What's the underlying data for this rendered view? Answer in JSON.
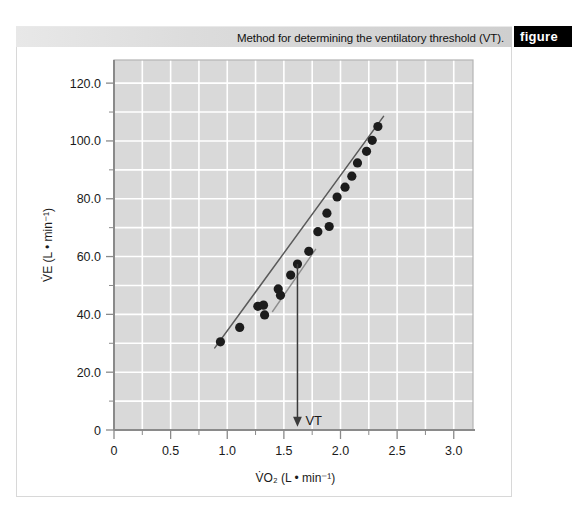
{
  "header": {
    "caption": "Method for determining the ventilatory threshold (VT).",
    "tab_label": "figure"
  },
  "chart_data": {
    "type": "scatter",
    "title": "",
    "subtitle": "",
    "xlabel": "V̇O₂ (L • min⁻¹)",
    "ylabel": "V̇E (L • min⁻¹)",
    "xlim": [
      0,
      3.17
    ],
    "ylim": [
      0,
      128
    ],
    "xticks": [
      0,
      0.5,
      1.0,
      1.5,
      2.0,
      2.5,
      3.0
    ],
    "xticklabels": [
      "0",
      "0.5",
      "1.0",
      "1.5",
      "2.0",
      "2.5",
      "3.0"
    ],
    "yticks": [
      0,
      20,
      40,
      60,
      80,
      100,
      120
    ],
    "yticklabels": [
      "0",
      "20.0",
      "40.0",
      "60.0",
      "80.0",
      "100.0",
      "120.0"
    ],
    "x_minor_step": 0.25,
    "y_minor_step": 10,
    "grid": true,
    "grid_color": "#ffffff",
    "plot_bg": "#d9d9d9",
    "legend": null,
    "marker_color": "#1c1c1c",
    "marker_size": 4.6,
    "points": [
      {
        "x": 0.94,
        "y": 30.5
      },
      {
        "x": 1.11,
        "y": 35.5
      },
      {
        "x": 1.27,
        "y": 42.8
      },
      {
        "x": 1.32,
        "y": 43.2
      },
      {
        "x": 1.33,
        "y": 39.8
      },
      {
        "x": 1.45,
        "y": 48.8
      },
      {
        "x": 1.47,
        "y": 46.6
      },
      {
        "x": 1.56,
        "y": 53.6
      },
      {
        "x": 1.62,
        "y": 57.4
      },
      {
        "x": 1.72,
        "y": 61.8
      },
      {
        "x": 1.8,
        "y": 68.6
      },
      {
        "x": 1.88,
        "y": 75.0
      },
      {
        "x": 1.9,
        "y": 70.4
      },
      {
        "x": 1.97,
        "y": 80.6
      },
      {
        "x": 2.04,
        "y": 84.0
      },
      {
        "x": 2.1,
        "y": 87.8
      },
      {
        "x": 2.15,
        "y": 92.4
      },
      {
        "x": 2.23,
        "y": 96.4
      },
      {
        "x": 2.28,
        "y": 100.2
      },
      {
        "x": 2.33,
        "y": 105.0
      }
    ],
    "fit_lines": [
      {
        "name": "below-threshold-slope",
        "x0": 0.89,
        "y0": 28.4,
        "x1": 2.38,
        "y1": 108.5,
        "color": "#5a5a5a",
        "width": 1.5
      },
      {
        "name": "above-threshold-slope",
        "x0": 1.4,
        "y0": 41.0,
        "x1": 1.78,
        "y1": 62.5,
        "color": "#8e8e8e",
        "width": 1.4
      }
    ],
    "annotations": [
      {
        "name": "vt-arrow",
        "label": "VT",
        "x": 1.62,
        "y_top": 57.4,
        "y_bottom": 1.5,
        "color": "#3a3a3a"
      }
    ]
  }
}
